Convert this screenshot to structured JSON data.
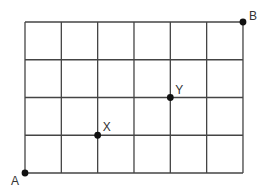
{
  "diagram": {
    "type": "grid-path",
    "grid": {
      "columns": 6,
      "rows": 4,
      "origin_px": [
        25,
        173
      ],
      "cell_width_px": 36.33,
      "cell_height_px": 37.75,
      "line_color": "#444444"
    },
    "points": [
      {
        "id": "A",
        "label": "A",
        "col": 0,
        "row": 0,
        "label_dx": -14,
        "label_dy": 12
      },
      {
        "id": "X",
        "label": "X",
        "col": 2,
        "row": 1,
        "label_dx": 5,
        "label_dy": -4
      },
      {
        "id": "Y",
        "label": "Y",
        "col": 4,
        "row": 2,
        "label_dx": 5,
        "label_dy": -4
      },
      {
        "id": "B",
        "label": "B",
        "col": 6,
        "row": 4,
        "label_dx": 6,
        "label_dy": -2
      }
    ],
    "point_color": "#111111"
  }
}
